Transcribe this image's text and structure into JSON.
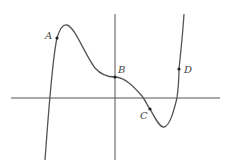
{
  "diagram": {
    "type": "function-graph",
    "axes": {
      "x_axis": {
        "x1": 11,
        "y": 98,
        "x2": 220
      },
      "y_axis": {
        "x": 115,
        "y1": 14,
        "y2": 160
      }
    },
    "curve_color": "#555555",
    "axis_color": "#555555",
    "points": [
      {
        "label": "A",
        "x": 57,
        "y": 38,
        "label_x": 45,
        "label_y": 39
      },
      {
        "label": "B",
        "x": 115,
        "y": 77,
        "label_x": 118,
        "label_y": 73
      },
      {
        "label": "C",
        "x": 150,
        "y": 109,
        "label_x": 140,
        "label_y": 119
      },
      {
        "label": "D",
        "x": 179,
        "y": 69,
        "label_x": 184,
        "label_y": 73
      }
    ]
  }
}
